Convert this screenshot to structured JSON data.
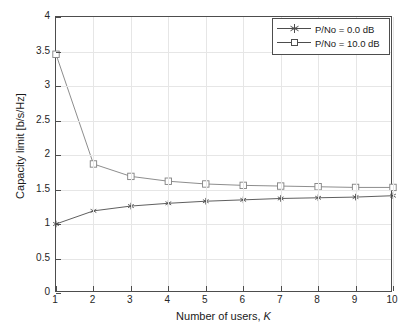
{
  "chart_data": {
    "type": "line",
    "title": "",
    "xlabel": "Number of users, K",
    "xlabel_plain": "Number of users, ",
    "xlabel_italic": "K",
    "ylabel": "Capacity limit [b/s/Hz]",
    "x": [
      1,
      2,
      3,
      4,
      5,
      6,
      7,
      8,
      9,
      10
    ],
    "xlim": [
      1,
      10
    ],
    "ylim": [
      0,
      4
    ],
    "xticks": [
      1,
      2,
      3,
      4,
      5,
      6,
      7,
      8,
      9,
      10
    ],
    "xtick_labels": [
      "1",
      "2",
      "3",
      "4",
      "5",
      "6",
      "7",
      "8",
      "9",
      "10"
    ],
    "yticks": [
      0,
      0.5,
      1,
      1.5,
      2,
      2.5,
      3,
      3.5,
      4
    ],
    "ytick_labels": [
      "0",
      "0.5",
      "1",
      "1.5",
      "2",
      "2.5",
      "3",
      "3.5",
      "4"
    ],
    "grid": true,
    "legend_position": "top-right",
    "series": [
      {
        "name": "P/No = 0.0 dB",
        "marker": "star",
        "color": "#4d4d4d",
        "values": [
          1.0,
          1.19,
          1.26,
          1.3,
          1.33,
          1.35,
          1.37,
          1.38,
          1.39,
          1.41
        ]
      },
      {
        "name": "P/No = 10.0 dB",
        "marker": "square",
        "color": "#808080",
        "values": [
          3.46,
          1.87,
          1.69,
          1.62,
          1.58,
          1.56,
          1.55,
          1.54,
          1.53,
          1.53
        ]
      }
    ]
  },
  "legend": {
    "items": [
      {
        "label": "P/No = 0.0 dB",
        "marker": "star-marker"
      },
      {
        "label": "P/No = 10.0 dB",
        "marker": "square-marker"
      }
    ]
  },
  "colors": {
    "axis": "#4d4d4d",
    "grid": "#e6e6e6",
    "series_0": "#4d4d4d",
    "series_1": "#808080",
    "background": "#ffffff",
    "text": "#1a1a1a"
  }
}
